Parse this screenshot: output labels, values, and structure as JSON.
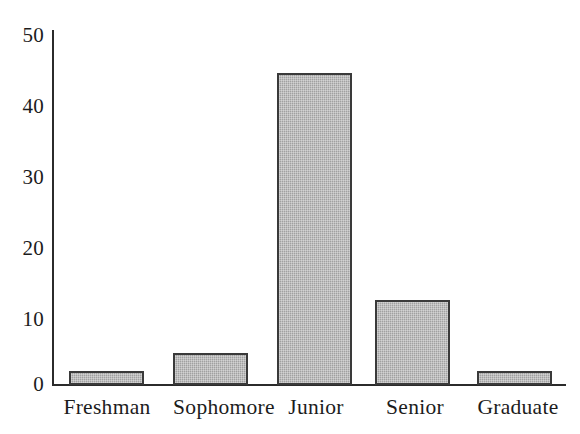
{
  "chart_data": {
    "type": "bar",
    "title": "",
    "subtitle": "",
    "xlabel": "",
    "ylabel": "",
    "categories": [
      "Freshman",
      "Sophomore",
      "Junior",
      "Senior",
      "Graduate"
    ],
    "values": [
      2,
      4.5,
      44,
      12,
      2
    ],
    "series": [
      {
        "name": "Count",
        "values": [
          2,
          4.5,
          44,
          12,
          2
        ]
      }
    ],
    "ylim": [
      0,
      50
    ],
    "yticks": [
      0,
      10,
      20,
      30,
      40,
      50
    ],
    "ytick_labels": [
      "0",
      "10",
      "20",
      "30",
      "40",
      "50"
    ],
    "grid": false,
    "legend": false,
    "legend_position": "none",
    "bar_fill_color": "#a9a9a9",
    "bar_edge_color": "#3a3a3a",
    "axis_color": "#2b2b2b",
    "background_color": "#ffffff"
  },
  "axis": {
    "y_label_0": "0",
    "y_label_10": "10",
    "y_label_20": "20",
    "y_label_30": "30",
    "y_label_40": "40",
    "y_label_50": "50"
  },
  "categories": {
    "c0": "Freshman",
    "c1": "Sophomore",
    "c2": "Junior",
    "c3": "Senior",
    "c4": "Graduate"
  }
}
